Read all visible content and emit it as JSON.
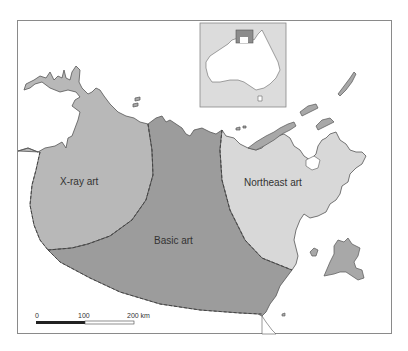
{
  "map": {
    "regions": [
      {
        "id": "xray",
        "label": "X-ray art",
        "fill": "#b8b8b8"
      },
      {
        "id": "basic",
        "label": "Basic art",
        "fill": "#9c9c9c"
      },
      {
        "id": "northeast",
        "label": "Northeast art",
        "fill": "#d8d8d8"
      }
    ],
    "colors": {
      "land_outline": "#555555",
      "island_fill": "#a8a8a8",
      "boundary_dash": "#444444",
      "inset_bg": "#dcdcdc",
      "inset_highlight": "#8c8c8c"
    },
    "scale_bar": {
      "labels": [
        "0",
        "100",
        "200 km"
      ]
    }
  }
}
